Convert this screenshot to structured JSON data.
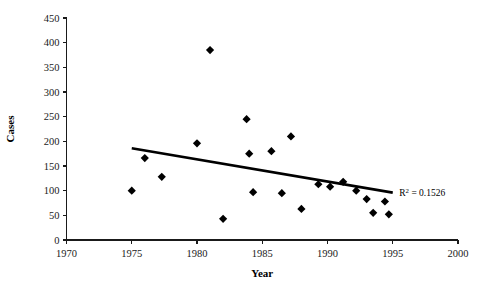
{
  "chart_data": {
    "type": "scatter",
    "title": "",
    "xlabel": "Year",
    "ylabel": "Cases",
    "xlim": [
      1970,
      2000
    ],
    "ylim": [
      0,
      450
    ],
    "xticks": [
      1970,
      1975,
      1980,
      1985,
      1990,
      1995,
      2000
    ],
    "yticks": [
      0,
      50,
      100,
      150,
      200,
      250,
      300,
      350,
      400,
      450
    ],
    "xtick_labels": [
      "1970",
      "1975",
      "1980",
      "1985",
      "1990",
      "1995",
      "2000"
    ],
    "ytick_labels": [
      "0",
      "50",
      "100",
      "150",
      "200",
      "250",
      "300",
      "350",
      "400",
      "450"
    ],
    "grid": false,
    "legend": "none",
    "marker": "diamond",
    "marker_color": "#000000",
    "points": [
      {
        "x": 1975.0,
        "y": 100
      },
      {
        "x": 1976.0,
        "y": 166
      },
      {
        "x": 1977.3,
        "y": 128
      },
      {
        "x": 1980.0,
        "y": 196
      },
      {
        "x": 1981.0,
        "y": 385
      },
      {
        "x": 1982.0,
        "y": 43
      },
      {
        "x": 1983.8,
        "y": 245
      },
      {
        "x": 1984.0,
        "y": 175
      },
      {
        "x": 1984.3,
        "y": 97
      },
      {
        "x": 1985.7,
        "y": 180
      },
      {
        "x": 1986.5,
        "y": 95
      },
      {
        "x": 1987.2,
        "y": 210
      },
      {
        "x": 1988.0,
        "y": 63
      },
      {
        "x": 1989.3,
        "y": 113
      },
      {
        "x": 1990.2,
        "y": 108
      },
      {
        "x": 1991.2,
        "y": 118
      },
      {
        "x": 1992.2,
        "y": 100
      },
      {
        "x": 1993.0,
        "y": 83
      },
      {
        "x": 1993.5,
        "y": 55
      },
      {
        "x": 1994.4,
        "y": 78
      },
      {
        "x": 1994.7,
        "y": 52
      }
    ],
    "trendline": {
      "x_start": 1975.0,
      "y_start": 186,
      "x_end": 1995.0,
      "y_end": 96
    },
    "annotations": [
      {
        "name": "r-squared",
        "prefix": "R",
        "superscript": "2",
        "suffix": " = 0.1526",
        "x": 1995.5,
        "y": 96
      }
    ]
  }
}
